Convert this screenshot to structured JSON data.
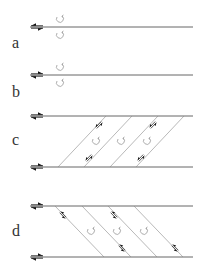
{
  "panels": [
    {
      "label": "a",
      "description": "single fault line with paired opposite shear arrows and two rotation markers"
    },
    {
      "label": "b",
      "description": "single fault line with reversed shear arrows and two rotation markers"
    },
    {
      "label": "c",
      "description": "two parallel fault lines connected by right-leaning synthetic shears with rotating blocks"
    },
    {
      "label": "d",
      "description": "two parallel fault lines connected by left-leaning antithetic shears with rotating blocks"
    }
  ],
  "colors": {
    "line": "#555555",
    "arrow": "#111111",
    "rotation": "#999999",
    "label": "#333333"
  }
}
